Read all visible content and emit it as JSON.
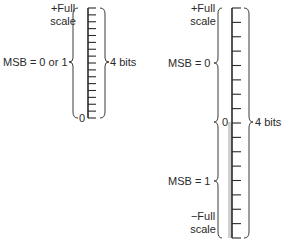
{
  "left_scale": {
    "top_label_line1": "+Full",
    "top_label_line2": "scale",
    "msb_label": "MSB = 0 or 1",
    "zero_label": "0",
    "bits_label": "4 bits",
    "tick_count": 16
  },
  "right_scale": {
    "top_label_line1": "+Full",
    "top_label_line2": "scale",
    "msb_upper_label": "MSB = 0",
    "msb_lower_label": "MSB = 1",
    "zero_label": "0",
    "bits_label": "4 bits",
    "bottom_label_line1": "−Full",
    "bottom_label_line2": "scale",
    "tick_count": 16,
    "negative_half_shade": "#cfcfcf"
  }
}
